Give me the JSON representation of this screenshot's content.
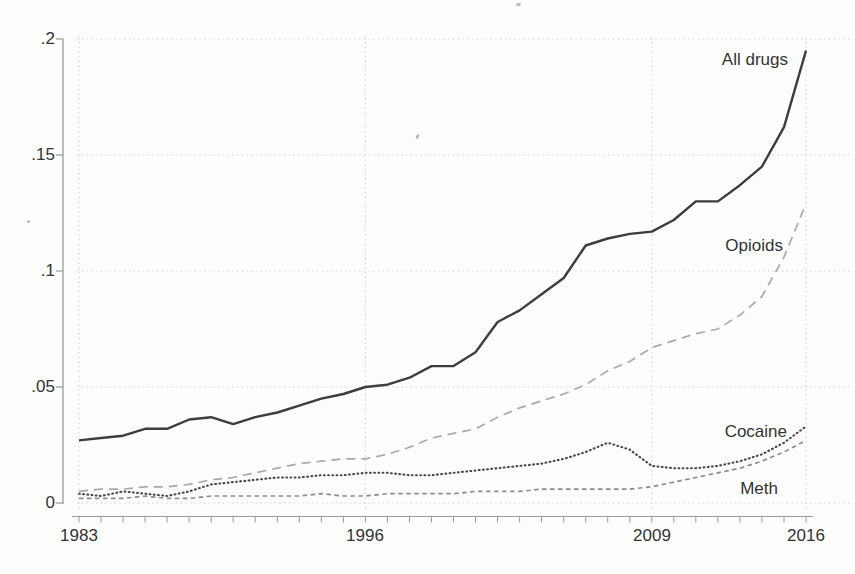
{
  "figure": {
    "background_color": "#fdfdfb",
    "text_color": "#333333",
    "axis_color": "#9a9a9a",
    "grid_color": "#d2d2cf"
  },
  "chart_data": {
    "type": "line",
    "title": "",
    "xlabel": "",
    "ylabel": "",
    "x_range": [
      1983,
      2016
    ],
    "y_range": [
      0,
      0.2
    ],
    "grid": "dotted horizontal gridlines at each y tick; dotted vertical gridlines at labeled years",
    "legend_position": "inline labels at right side of lines",
    "years": [
      1983,
      1984,
      1985,
      1986,
      1987,
      1988,
      1989,
      1990,
      1991,
      1992,
      1993,
      1994,
      1995,
      1996,
      1997,
      1998,
      1999,
      2000,
      2001,
      2002,
      2003,
      2004,
      2005,
      2006,
      2007,
      2008,
      2009,
      2010,
      2011,
      2012,
      2013,
      2014,
      2015,
      2016
    ],
    "y_ticks": [
      {
        "value": 0,
        "label": "0"
      },
      {
        "value": 0.05,
        "label": ".05"
      },
      {
        "value": 0.1,
        "label": ".1"
      },
      {
        "value": 0.15,
        "label": ".15"
      },
      {
        "value": 0.2,
        "label": ".2"
      }
    ],
    "x_ticks_labeled": [
      {
        "value": 1983,
        "label": "1983"
      },
      {
        "value": 1996,
        "label": "1996"
      },
      {
        "value": 2009,
        "label": "2009"
      },
      {
        "value": 2016,
        "label": "2016"
      }
    ],
    "series": [
      {
        "name": "all-drugs",
        "label": "All drugs",
        "line_style": "solid",
        "color": "#3d3d3d",
        "values": [
          0.027,
          0.028,
          0.029,
          0.032,
          0.032,
          0.036,
          0.037,
          0.034,
          0.037,
          0.039,
          0.042,
          0.045,
          0.047,
          0.05,
          0.051,
          0.054,
          0.059,
          0.059,
          0.065,
          0.078,
          0.083,
          0.09,
          0.097,
          0.111,
          0.114,
          0.116,
          0.117,
          0.122,
          0.13,
          0.13,
          0.137,
          0.145,
          0.162,
          0.195
        ]
      },
      {
        "name": "opioids",
        "label": "Opioids",
        "line_style": "dashed",
        "color": "#a9a9a9",
        "values": [
          0.005,
          0.006,
          0.006,
          0.007,
          0.007,
          0.008,
          0.01,
          0.011,
          0.013,
          0.015,
          0.017,
          0.018,
          0.019,
          0.019,
          0.021,
          0.024,
          0.028,
          0.03,
          0.032,
          0.037,
          0.041,
          0.044,
          0.047,
          0.051,
          0.057,
          0.061,
          0.067,
          0.07,
          0.073,
          0.075,
          0.081,
          0.089,
          0.106,
          0.129
        ]
      },
      {
        "name": "cocaine",
        "label": "Cocaine",
        "line_style": "dotted",
        "color": "#474747",
        "values": [
          0.004,
          0.003,
          0.005,
          0.004,
          0.003,
          0.005,
          0.008,
          0.009,
          0.01,
          0.011,
          0.011,
          0.012,
          0.012,
          0.013,
          0.013,
          0.012,
          0.012,
          0.013,
          0.014,
          0.015,
          0.016,
          0.017,
          0.019,
          0.022,
          0.026,
          0.023,
          0.016,
          0.015,
          0.015,
          0.016,
          0.018,
          0.021,
          0.026,
          0.033
        ]
      },
      {
        "name": "meth",
        "label": "Meth",
        "line_style": "short-dash",
        "color": "#8c8c8c",
        "values": [
          0.002,
          0.002,
          0.002,
          0.003,
          0.002,
          0.002,
          0.003,
          0.003,
          0.003,
          0.003,
          0.003,
          0.004,
          0.003,
          0.003,
          0.004,
          0.004,
          0.004,
          0.004,
          0.005,
          0.005,
          0.005,
          0.006,
          0.006,
          0.006,
          0.006,
          0.006,
          0.007,
          0.009,
          0.011,
          0.013,
          0.015,
          0.018,
          0.022,
          0.027
        ]
      }
    ]
  }
}
